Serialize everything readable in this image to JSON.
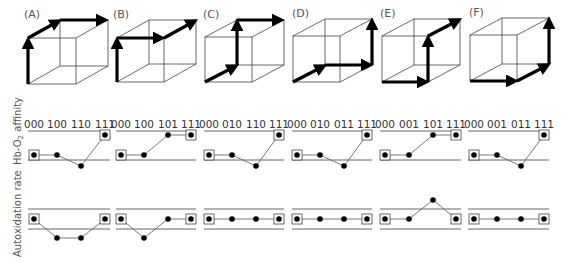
{
  "chart_data": {
    "type": "diagram",
    "title": "",
    "rows": [
      "Cube pathways",
      "Hb-O2 affinity",
      "Autoxidation rate"
    ],
    "ylabels": {
      "affinity": "Hb-O",
      "affinity_sub": "2",
      "affinity_tail": " affinity",
      "autox": "Autoxidation rate"
    },
    "panels": [
      {
        "label": "(A)",
        "path": [
          "000",
          "100",
          "110",
          "111"
        ],
        "affinity": [
          0,
          0,
          -1,
          1
        ],
        "autoxidation": [
          0,
          -1,
          -1,
          0
        ],
        "boxed": [
          0,
          3
        ]
      },
      {
        "label": "(B)",
        "path": [
          "000",
          "100",
          "101",
          "111"
        ],
        "affinity": [
          0,
          0,
          1,
          1
        ],
        "autoxidation": [
          0,
          -1,
          0,
          0
        ],
        "boxed": [
          0,
          3
        ]
      },
      {
        "label": "(C)",
        "path": [
          "000",
          "010",
          "110",
          "111"
        ],
        "affinity": [
          0,
          0,
          -1,
          1
        ],
        "autoxidation": [
          0,
          0,
          0,
          0
        ],
        "boxed": [
          0,
          3
        ]
      },
      {
        "label": "(D)",
        "path": [
          "000",
          "010",
          "011",
          "111"
        ],
        "affinity": [
          0,
          0,
          -1,
          1
        ],
        "autoxidation": [
          0,
          0,
          0,
          0
        ],
        "boxed": [
          0,
          3
        ]
      },
      {
        "label": "(E)",
        "path": [
          "000",
          "001",
          "101",
          "111"
        ],
        "affinity": [
          0,
          0,
          1,
          1
        ],
        "autoxidation": [
          0,
          0,
          1,
          0
        ],
        "boxed": [
          0,
          3
        ]
      },
      {
        "label": "(F)",
        "path": [
          "000",
          "001",
          "011",
          "111"
        ],
        "affinity": [
          0,
          0,
          -1,
          1
        ],
        "autoxidation": [
          0,
          0,
          0,
          0
        ],
        "boxed": [
          0,
          3
        ]
      }
    ]
  },
  "panels_text": {
    "A": {
      "label": "(A)",
      "t0": "000",
      "t1": "100",
      "t2": "110",
      "t3": "111"
    },
    "B": {
      "label": "(B)",
      "t0": "000",
      "t1": "100",
      "t2": "101",
      "t3": "111"
    },
    "C": {
      "label": "(C)",
      "t0": "000",
      "t1": "010",
      "t2": "110",
      "t3": "111"
    },
    "D": {
      "label": "(D)",
      "t0": "000",
      "t1": "010",
      "t2": "011",
      "t3": "111"
    },
    "E": {
      "label": "(E)",
      "t0": "000",
      "t1": "001",
      "t2": "101",
      "t3": "111"
    },
    "F": {
      "label": "(F)",
      "t0": "000",
      "t1": "001",
      "t2": "011",
      "t3": "111"
    }
  },
  "ylabels": {
    "affinity_main": "Hb-O",
    "affinity_sub": "2",
    "affinity_tail": " affinity",
    "autox": "Autoxidation rate"
  }
}
